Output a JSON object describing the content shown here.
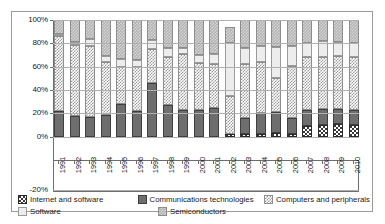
{
  "chart_data": {
    "type": "bar",
    "stacked": true,
    "normalized_percent": true,
    "title": "",
    "subtitle": "",
    "xlabel": "",
    "ylabel": "",
    "ylim": [
      -20,
      100
    ],
    "ytick_labels": [
      "100%",
      "80%",
      "60%",
      "40%",
      "20%",
      "0%",
      "-20%"
    ],
    "ytick_values": [
      100,
      80,
      60,
      40,
      20,
      0,
      -20
    ],
    "grid": true,
    "legend_position": "bottom",
    "categories": [
      "1991",
      "1992",
      "1993",
      "1994",
      "1995",
      "1996",
      "1997",
      "1998",
      "1999",
      "2000",
      "2001",
      "2002",
      "2003",
      "2004",
      "2005",
      "2006",
      "2007",
      "2008",
      "2009",
      "2010"
    ],
    "series": [
      {
        "name": "Internet and software",
        "swatch": "s-internet",
        "values": [
          0,
          0,
          0,
          0,
          0,
          0,
          0,
          0,
          0,
          0,
          0,
          2,
          2,
          2,
          3,
          2,
          9,
          10,
          11,
          10
        ]
      },
      {
        "name": "Communications technologies",
        "swatch": "s-comm",
        "values": [
          22,
          18,
          17,
          19,
          28,
          22,
          46,
          27,
          23,
          23,
          25,
          0,
          14,
          18,
          18,
          14,
          14,
          14,
          13,
          13
        ]
      },
      {
        "name": "Computers and peripherals",
        "swatch": "s-computers",
        "values": [
          64,
          61,
          61,
          45,
          32,
          38,
          29,
          41,
          48,
          40,
          37,
          33,
          46,
          44,
          29,
          45,
          45,
          44,
          45,
          45
        ]
      },
      {
        "name": "Software",
        "swatch": "s-software",
        "values": [
          2,
          2,
          6,
          5,
          7,
          6,
          8,
          8,
          5,
          7,
          9,
          45,
          14,
          14,
          27,
          17,
          12,
          14,
          12,
          12
        ]
      },
      {
        "name": "Semiconductors",
        "swatch": "s-semis",
        "values": [
          12,
          19,
          16,
          31,
          33,
          34,
          17,
          24,
          24,
          30,
          29,
          14,
          24,
          22,
          23,
          22,
          20,
          18,
          19,
          20
        ]
      }
    ]
  },
  "legend": {
    "items": [
      {
        "label": "Internet and software",
        "swatch": "s-internet"
      },
      {
        "label": "Communications technologies",
        "swatch": "s-comm"
      },
      {
        "label": "Computers and peripherals",
        "swatch": "s-computers"
      },
      {
        "label": "Software",
        "swatch": "s-software"
      },
      {
        "label": "Semiconductors",
        "swatch": "s-semis"
      }
    ]
  }
}
